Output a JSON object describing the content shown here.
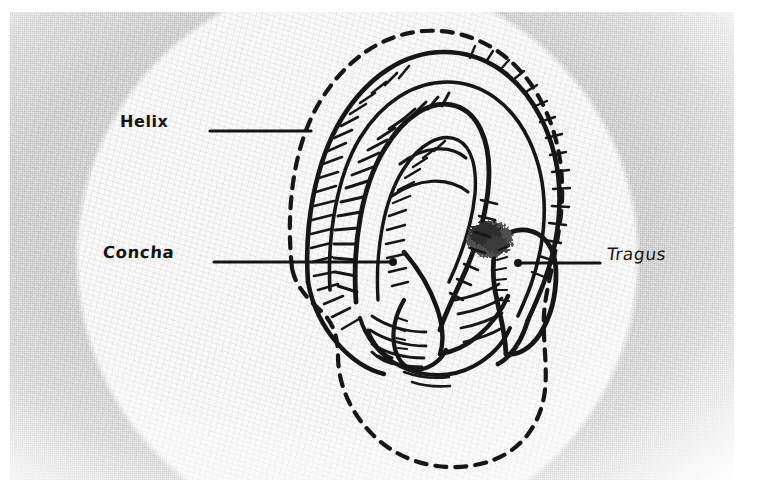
{
  "figure": {
    "medium": "scanned pen-and-ink anatomical line drawing",
    "background_color": "#e9e9e9",
    "ink_color": "#141414",
    "shading_color": "#4a4a4a"
  },
  "labels": [
    {
      "id": "helix",
      "text": "Helix",
      "text_x": 120,
      "text_y": 112,
      "leader": {
        "x1": 210,
        "y1": 131,
        "x2": 311,
        "y2": 131,
        "dot": "none"
      }
    },
    {
      "id": "concha",
      "text": "Concha",
      "text_x": 103,
      "text_y": 243,
      "leader": {
        "x1": 214,
        "y1": 262,
        "x2": 393,
        "y2": 262,
        "dot": "end"
      }
    },
    {
      "id": "tragus",
      "text": "Tragus",
      "text_x": 607,
      "text_y": 244,
      "leader": {
        "x1": 518,
        "y1": 263,
        "x2": 600,
        "y2": 263,
        "dot": "start"
      }
    }
  ],
  "annotations": {
    "dashed_outline_meaning": "normal ear outline",
    "solid_outline_meaning": "drawn ear cartilage contours",
    "shaded_blob_meaning": "dark stippled shading above tragus"
  }
}
